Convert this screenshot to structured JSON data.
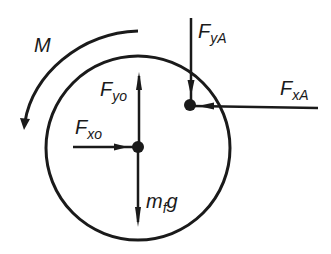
{
  "diagram": {
    "type": "free-body-diagram",
    "colors": {
      "ink": "#1a1a1a",
      "background": "#ffffff"
    },
    "body": {
      "shape": "circle",
      "center": [
        138,
        148
      ],
      "radius": 92
    },
    "points": {
      "O": {
        "x": 138,
        "y": 147
      },
      "A": {
        "x": 190,
        "y": 104
      }
    },
    "moment": {
      "label": "M",
      "direction": "counterclockwise"
    },
    "forces": [
      {
        "id": "Fyo",
        "main": "F",
        "sub": "yo",
        "at": "O",
        "direction": "up"
      },
      {
        "id": "Fxo",
        "main": "F",
        "sub": "xo",
        "at": "O",
        "direction": "right"
      },
      {
        "id": "mfg",
        "main": "m",
        "sub": "f",
        "tail": "g",
        "at": "O",
        "direction": "down"
      },
      {
        "id": "FyA",
        "main": "F",
        "sub": "yA",
        "at": "A",
        "direction": "down"
      },
      {
        "id": "FxA",
        "main": "F",
        "sub": "xA",
        "at": "A",
        "direction": "left"
      }
    ]
  }
}
